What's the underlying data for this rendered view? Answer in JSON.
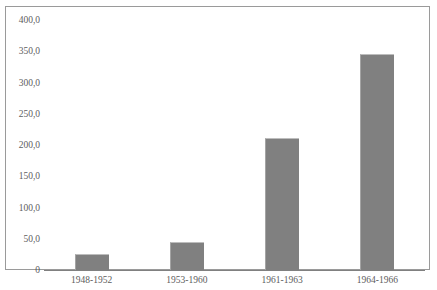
{
  "chart_data": {
    "type": "bar",
    "title": "",
    "subtitle": "",
    "xlabel": "",
    "ylabel": "",
    "categories": [
      "1948-1952",
      "1953-1960",
      "1961-1963",
      "1964-1966"
    ],
    "values": [
      26.0,
      45.0,
      212.0,
      345.0
    ],
    "series": [
      {
        "name": "",
        "values": [
          26.0,
          45.0,
          212.0,
          345.0
        ]
      }
    ],
    "ylim": [
      0,
      400
    ],
    "ytick_values": [
      0,
      50,
      100,
      150,
      200,
      250,
      300,
      350,
      400
    ],
    "ytick_labels": [
      "0",
      "50,0",
      "100,0",
      "150,0",
      "200,0",
      "250,0",
      "300,0",
      "350,0",
      "400,0"
    ],
    "grid": false,
    "legend": null,
    "legend_position": "none",
    "decimal_separator": ",",
    "bar_color": "#808080",
    "axis_color": "#808080",
    "frame_color": "#9a9a9a",
    "text_color": "#5d5d5d",
    "background": "#ffffff"
  },
  "top_clipped_text": {
    "ghost": ""
  }
}
